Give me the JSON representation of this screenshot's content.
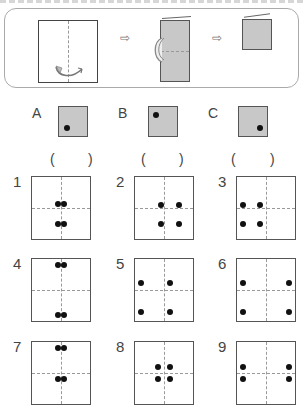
{
  "instructions": {
    "steps": [
      "unfolded-sheet-with-fold-arrow",
      "folded-in-half-vertically",
      "folded-again-horizontally"
    ],
    "arrow_glyph": "⇨"
  },
  "options": [
    {
      "label": "A",
      "dot": "bottom-left",
      "answer_open": "(",
      "answer_close": ")"
    },
    {
      "label": "B",
      "dot": "top-left",
      "answer_open": "(",
      "answer_close": ")"
    },
    {
      "label": "C",
      "dot": "bottom-right",
      "answer_open": "(",
      "answer_close": ")"
    }
  ],
  "choices": [
    {
      "number": "1",
      "dots": [
        [
          44,
          44
        ],
        [
          56,
          44
        ],
        [
          44,
          75
        ],
        [
          56,
          75
        ]
      ]
    },
    {
      "number": "2",
      "dots": [
        [
          45,
          45
        ],
        [
          75,
          45
        ],
        [
          45,
          75
        ],
        [
          75,
          75
        ]
      ]
    },
    {
      "number": "3",
      "dots": [
        [
          10,
          45
        ],
        [
          40,
          45
        ],
        [
          10,
          75
        ],
        [
          40,
          75
        ]
      ]
    },
    {
      "number": "4",
      "dots": [
        [
          44,
          10
        ],
        [
          56,
          10
        ],
        [
          44,
          90
        ],
        [
          56,
          90
        ]
      ]
    },
    {
      "number": "5",
      "dots": [
        [
          10,
          38
        ],
        [
          60,
          38
        ],
        [
          10,
          86
        ],
        [
          60,
          86
        ]
      ]
    },
    {
      "number": "6",
      "dots": [
        [
          10,
          38
        ],
        [
          90,
          38
        ],
        [
          10,
          86
        ],
        [
          90,
          86
        ]
      ]
    },
    {
      "number": "7",
      "dots": [
        [
          44,
          10
        ],
        [
          56,
          10
        ],
        [
          44,
          60
        ],
        [
          56,
          60
        ]
      ]
    },
    {
      "number": "8",
      "dots": [
        [
          40,
          40
        ],
        [
          60,
          40
        ],
        [
          40,
          60
        ],
        [
          60,
          60
        ]
      ]
    },
    {
      "number": "9",
      "dots": [
        [
          10,
          40
        ],
        [
          90,
          40
        ],
        [
          10,
          60
        ],
        [
          90,
          60
        ]
      ]
    }
  ]
}
